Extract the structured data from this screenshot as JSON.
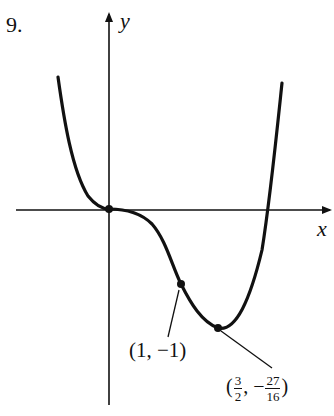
{
  "problem_number": "9.",
  "axes": {
    "x_label": "x",
    "y_label": "y"
  },
  "function": "y = x^4 - 2x^3",
  "points": [
    {
      "name": "origin",
      "x": 0,
      "y": 0
    },
    {
      "name": "inflection",
      "label": "(1, −1)",
      "x": 1,
      "y": -1
    },
    {
      "name": "minimum",
      "x": 1.5,
      "y": -1.6875,
      "label_open": "(",
      "x_num": "3",
      "x_den": "2",
      "sep": ", −",
      "y_num": "27",
      "y_den": "16",
      "label_close": ")"
    }
  ],
  "colors": {
    "ink": "#111111",
    "background": "#ffffff"
  }
}
